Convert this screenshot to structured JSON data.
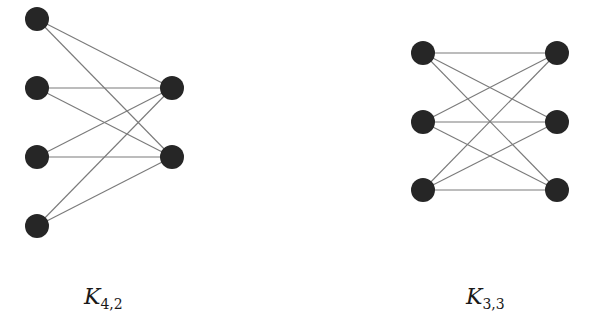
{
  "colors": {
    "node": "#262626",
    "edge": "#7a7a7a",
    "background": "#ffffff"
  },
  "graphs": [
    {
      "id": "k42",
      "name": "K",
      "subscript": "4,2",
      "label_pos": {
        "x": 84,
        "y": 284
      },
      "node_radius": 12,
      "left": [
        {
          "x": 37,
          "y": 19
        },
        {
          "x": 37,
          "y": 88
        },
        {
          "x": 37,
          "y": 157
        },
        {
          "x": 37,
          "y": 226
        }
      ],
      "right": [
        {
          "x": 172,
          "y": 88
        },
        {
          "x": 172,
          "y": 157
        }
      ]
    },
    {
      "id": "k33",
      "name": "K",
      "subscript": "3,3",
      "label_pos": {
        "x": 466,
        "y": 284
      },
      "node_radius": 12,
      "left": [
        {
          "x": 423,
          "y": 53
        },
        {
          "x": 423,
          "y": 122
        },
        {
          "x": 423,
          "y": 190
        }
      ],
      "right": [
        {
          "x": 557,
          "y": 53
        },
        {
          "x": 557,
          "y": 122
        },
        {
          "x": 557,
          "y": 190
        }
      ]
    }
  ]
}
